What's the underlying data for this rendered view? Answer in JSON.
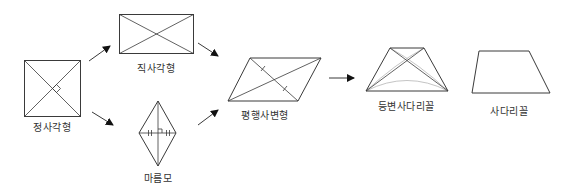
{
  "diagram": {
    "type": "quadrilateral-hierarchy",
    "colors": {
      "stroke": "#3a3a3a",
      "faint": "#b5b5b5",
      "background": "#ffffff"
    },
    "nodes": [
      {
        "id": "square",
        "label": "정사각형",
        "marks": [
          "diagonals",
          "right-angle"
        ]
      },
      {
        "id": "rectangle",
        "label": "직사각형",
        "marks": [
          "diagonals"
        ]
      },
      {
        "id": "rhombus",
        "label": "마름모",
        "marks": [
          "diagonals",
          "right-angle",
          "equal-ticks"
        ]
      },
      {
        "id": "parallelogram",
        "label": "평행사변형",
        "marks": [
          "diagonals",
          "bisect-ticks"
        ]
      },
      {
        "id": "isosceles-trapezoid",
        "label": "등변사다리꼴",
        "marks": [
          "diagonals",
          "arcs"
        ]
      },
      {
        "id": "trapezoid",
        "label": "사다리꼴",
        "marks": []
      }
    ],
    "edges": [
      {
        "from": "square",
        "to": "rectangle"
      },
      {
        "from": "square",
        "to": "rhombus"
      },
      {
        "from": "rectangle",
        "to": "parallelogram"
      },
      {
        "from": "rhombus",
        "to": "parallelogram"
      },
      {
        "from": "parallelogram",
        "to": "isosceles-trapezoid"
      }
    ]
  }
}
